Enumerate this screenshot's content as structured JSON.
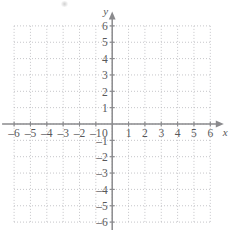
{
  "figure": {
    "kind": "cartesian-coordinate-plane",
    "background_color": "#ffffff",
    "axis_color": "#8a8a8d",
    "grid_color": "#b9b9bd",
    "label_color": "#58585a"
  },
  "axes": {
    "x_axis_name": "x",
    "y_axis_name": "y",
    "origin_label": "0",
    "x_arrow": "right-arrowhead",
    "y_arrow": "up-arrowhead"
  },
  "chart_data": {
    "type": "scatter",
    "title": "",
    "subtitle": "",
    "xlabel": "x",
    "ylabel": "y",
    "xlim": [
      -6,
      6
    ],
    "ylim": [
      -6,
      6
    ],
    "grid": true,
    "grid_style": "dotted",
    "grid_step": 1,
    "legend": null,
    "legend_position": "none",
    "annotations": [],
    "series": [],
    "x_ticks": [
      -6,
      -5,
      -4,
      -3,
      -2,
      -1,
      0,
      1,
      2,
      3,
      4,
      5,
      6
    ],
    "y_ticks": [
      -6,
      -5,
      -4,
      -3,
      -2,
      -1,
      1,
      2,
      3,
      4,
      5,
      6
    ],
    "x_tick_labels": [
      "–6",
      "–5",
      "–4",
      "–3",
      "–2",
      "–1",
      "0",
      "1",
      "2",
      "3",
      "4",
      "5",
      "6"
    ],
    "y_tick_labels_positive": [
      "6",
      "5",
      "4",
      "3",
      "2",
      "1"
    ],
    "y_tick_labels_negative": [
      "–1",
      "–2",
      "–3",
      "–4",
      "–5",
      "–6"
    ]
  },
  "x_tick_items": [
    {
      "value": -6,
      "label": "–6"
    },
    {
      "value": -5,
      "label": "–5"
    },
    {
      "value": -4,
      "label": "–4"
    },
    {
      "value": -3,
      "label": "–3"
    },
    {
      "value": -2,
      "label": "–2"
    },
    {
      "value": -1,
      "label": "–1"
    },
    {
      "value": 1,
      "label": "1"
    },
    {
      "value": 2,
      "label": "2"
    },
    {
      "value": 3,
      "label": "3"
    },
    {
      "value": 4,
      "label": "4"
    },
    {
      "value": 5,
      "label": "5"
    },
    {
      "value": 6,
      "label": "6"
    }
  ],
  "y_tick_items": [
    {
      "value": 6,
      "label": "6"
    },
    {
      "value": 5,
      "label": "5"
    },
    {
      "value": 4,
      "label": "4"
    },
    {
      "value": 3,
      "label": "3"
    },
    {
      "value": 2,
      "label": "2"
    },
    {
      "value": 1,
      "label": "1"
    },
    {
      "value": -1,
      "label": "–1"
    },
    {
      "value": -2,
      "label": "–2"
    },
    {
      "value": -3,
      "label": "–3"
    },
    {
      "value": -4,
      "label": "–4"
    },
    {
      "value": -5,
      "label": "–5"
    },
    {
      "value": -6,
      "label": "–6"
    }
  ]
}
